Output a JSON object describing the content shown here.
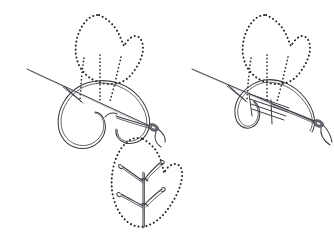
{
  "figure": {
    "background_color": "#ffffff",
    "line_color": "#3b3b42",
    "dotted_color": "#26262b",
    "needle_color": "#6f6f79",
    "width": 334,
    "height": 248,
    "panel_count": 3
  },
  "panels": [
    {
      "id": "panel-step-1",
      "name": "step-one-needle-through-loop",
      "label": "",
      "origin": {
        "x": 0,
        "y": 0
      },
      "description": "Needle entering fabric at top of leaf with large working thread loop held below",
      "leaf_outline": {
        "name": "leaf-outline-dotted",
        "points": "98,14 104,19 112,22 118,28 122,36 125,44 128,40 133,36 139,38 142,45 141,53 138,60 134,66 130,72 126,77 120,80 112,81 104,80 96,78 89,74 83,68 79,61 76,53 75,45 76,37 79,30 84,23 90,17"
      },
      "guide_lines": [
        {
          "name": "guide-line-left",
          "from": {
            "x": 83,
            "y": 59
          },
          "to": {
            "x": 80,
            "y": 99
          }
        },
        {
          "name": "guide-line-center",
          "from": {
            "x": 100,
            "y": 56
          },
          "to": {
            "x": 100,
            "y": 102
          }
        },
        {
          "name": "guide-line-right",
          "from": {
            "x": 119,
            "y": 58
          },
          "to": {
            "x": 110,
            "y": 100
          }
        }
      ],
      "thread_loop": {
        "name": "working-thread-loop",
        "type": "large-open-loop"
      },
      "needle": {
        "name": "needle",
        "tip": {
          "x": 82,
          "y": 101
        },
        "eye": {
          "x": 152,
          "y": 125
        },
        "angle_deg": 20
      }
    },
    {
      "id": "panel-step-2",
      "name": "step-two-thread-pulled-tight",
      "label": "",
      "origin": {
        "x": 167,
        "y": 0
      },
      "description": "Thread pulled taut forming narrow anchored loop with satin fill strokes along the stem",
      "leaf_outline": {
        "name": "leaf-outline-dotted",
        "points": "265,14 271,19 279,22 285,28 289,36 292,44 295,40 300,36 306,38 309,45 308,53 305,60 301,66 297,72 293,77 287,80 279,81 271,80 263,78 256,74 250,68 246,61 243,53 242,45 243,37 246,30 251,23 257,17"
      },
      "guide_lines": [
        {
          "name": "guide-line-left",
          "from": {
            "x": 250,
            "y": 59
          },
          "to": {
            "x": 247,
            "y": 99
          }
        },
        {
          "name": "guide-line-center",
          "from": {
            "x": 267,
            "y": 56
          },
          "to": {
            "x": 267,
            "y": 102
          }
        },
        {
          "name": "guide-line-right",
          "from": {
            "x": 286,
            "y": 58
          },
          "to": {
            "x": 277,
            "y": 100
          }
        }
      ],
      "satin_strokes": {
        "name": "satin-fill-strokes",
        "count": 4
      },
      "needle": {
        "name": "needle",
        "tip": {
          "x": 246,
          "y": 88
        },
        "eye": {
          "x": 318,
          "y": 122
        },
        "angle_deg": 22
      }
    },
    {
      "id": "panel-finished",
      "name": "finished-leaf-sample",
      "label": "",
      "origin": {
        "x": 100,
        "y": 135
      },
      "description": "Completed leaf with two fly stitches forming V shapes along a central stem",
      "leaf_outline": {
        "name": "leaf-outline-dotted",
        "points": "142,140 147,145 152,150 157,157 160,165 162,173 166,168 171,164 176,167 178,175 177,184 174,192 170,200 165,208 159,215 152,221 145,224 137,224 130,221 124,215 119,207 115,198 113,189 112,180 113,171 116,163 120,155 126,149 133,143"
      },
      "stitches": [
        {
          "name": "fly-stitch-upper",
          "apex": {
            "x": 143,
            "y": 180
          },
          "left_arm_end": {
            "x": 122,
            "y": 166
          },
          "right_arm_end": {
            "x": 162,
            "y": 163
          }
        },
        {
          "name": "fly-stitch-lower",
          "apex": {
            "x": 143,
            "y": 205
          },
          "left_arm_end": {
            "x": 120,
            "y": 194
          },
          "right_arm_end": {
            "x": 163,
            "y": 190
          }
        }
      ],
      "stem": {
        "name": "center-stem",
        "from": {
          "x": 143,
          "y": 176
        },
        "to": {
          "x": 143,
          "y": 224
        }
      }
    }
  ],
  "elements": {
    "needle_label": "sewing-needle",
    "thread_label": "embroidery-thread",
    "dotted_outline_label": "traced-leaf-guideline",
    "fly_stitch_label": "fly-stitch"
  }
}
